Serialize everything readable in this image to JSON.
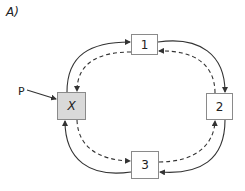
{
  "panel_label": "A)",
  "pointer_label": "P",
  "colors": {
    "line": "#333333",
    "node_border": "#8a8a8a",
    "highlight_fill": "#d9d9d9"
  },
  "nodes": [
    {
      "id": "x",
      "label": "X",
      "highlighted": true
    },
    {
      "id": "1",
      "label": "1",
      "highlighted": false
    },
    {
      "id": "2",
      "label": "2",
      "highlighted": false
    },
    {
      "id": "3",
      "label": "3",
      "highlighted": false
    }
  ],
  "edges": [
    {
      "from": "X",
      "to": "1",
      "style": "solid"
    },
    {
      "from": "1",
      "to": "X",
      "style": "dashed"
    },
    {
      "from": "1",
      "to": "2",
      "style": "solid"
    },
    {
      "from": "2",
      "to": "1",
      "style": "dashed"
    },
    {
      "from": "2",
      "to": "3",
      "style": "solid"
    },
    {
      "from": "3",
      "to": "2",
      "style": "dashed"
    },
    {
      "from": "3",
      "to": "X",
      "style": "solid"
    },
    {
      "from": "X",
      "to": "3",
      "style": "dashed"
    },
    {
      "from": "P",
      "to": "X",
      "style": "solid"
    }
  ]
}
